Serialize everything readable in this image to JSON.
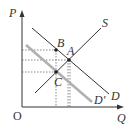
{
  "diagram": {
    "title": "",
    "axes": {
      "y_label": "P",
      "x_label": "Q",
      "origin_label": "O"
    },
    "curves": [
      {
        "name": "S",
        "label": "S",
        "color": "#333333"
      },
      {
        "name": "D",
        "label": "D",
        "color": "#333333"
      },
      {
        "name": "D'",
        "label": "D'",
        "color": "#b0b0b0"
      }
    ],
    "points": [
      {
        "label": "A",
        "description": "intersection of S and D"
      },
      {
        "label": "B",
        "description": "point on D above C"
      },
      {
        "label": "C",
        "description": "intersection of S and D'"
      }
    ],
    "colors": {
      "line": "#333333",
      "shifted_demand": "#b0b0b0",
      "guide": "#555555",
      "background": "#ffffff"
    }
  }
}
